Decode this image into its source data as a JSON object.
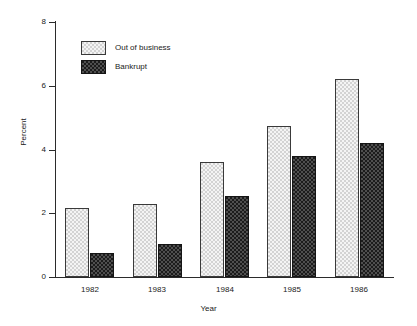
{
  "chart_data": {
    "type": "bar",
    "title": "",
    "xlabel": "Year",
    "ylabel": "Percent",
    "categories": [
      "1982",
      "1983",
      "1984",
      "1985",
      "1986"
    ],
    "series": [
      {
        "name": "Out of business",
        "values": [
          2.15,
          2.3,
          3.6,
          4.75,
          6.2
        ],
        "color": "#d3d3d3"
      },
      {
        "name": "Bankrupt",
        "values": [
          0.75,
          1.05,
          2.55,
          3.8,
          4.2
        ],
        "color": "#1c1c1c"
      }
    ],
    "ylim": [
      0,
      8
    ],
    "yticks": [
      0,
      2,
      4,
      6,
      8
    ],
    "ytick_labels": [
      "0",
      "2",
      "4",
      "6",
      "8"
    ],
    "grid": false,
    "legend_position": "top-left"
  },
  "legend": {
    "items": [
      {
        "label": "Out of business",
        "swatch": "light-checker-swatch"
      },
      {
        "label": "Bankrupt",
        "swatch": "dark-checker-swatch"
      }
    ]
  },
  "axes": {
    "y_title": "Percent",
    "x_title": "Year"
  }
}
